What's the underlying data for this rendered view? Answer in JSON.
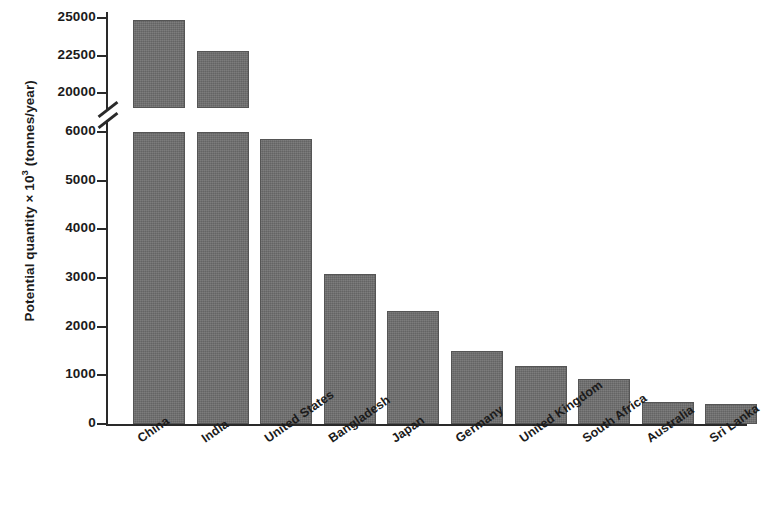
{
  "chart_data": {
    "type": "bar",
    "title": "",
    "subtitle": "",
    "xlabel": "",
    "ylabel": "Potential quantity × 10³ (tonnes/year)",
    "ylabel_parts": {
      "prefix": "Potential quantity",
      "multiplier": "× 10",
      "exponent": "3",
      "unit": "(tonnes/year)"
    },
    "categories": [
      "China",
      "India",
      "United States",
      "Bangladesh",
      "Japan",
      "Germany",
      "United Kingdom",
      "South Africa",
      "Australia",
      "Sri Lanka"
    ],
    "values": [
      24900,
      22800,
      5850,
      3080,
      2320,
      1500,
      1200,
      930,
      460,
      420
    ],
    "broken_axis": true,
    "axis_break_between": [
      6000,
      20000
    ],
    "lower_ticks": [
      0,
      1000,
      2000,
      3000,
      4000,
      5000,
      6000
    ],
    "upper_ticks": [
      20000,
      22500,
      25000
    ],
    "ytick_labels": [
      "0",
      "1000",
      "2000",
      "3000",
      "4000",
      "5000",
      "6000",
      "20000",
      "22500",
      "25000"
    ],
    "ylim_lower": [
      0,
      6000
    ],
    "ylim_upper": [
      19000,
      25400
    ],
    "grid": false,
    "legend": false,
    "legend_position": "none",
    "bar_color": "#6e6e6e",
    "bar_edge_color": "#555555",
    "axis_color": "#2a2a2a",
    "text_color": "#1b1b1b",
    "background": "#ffffff",
    "label_rotation_deg": -35
  }
}
